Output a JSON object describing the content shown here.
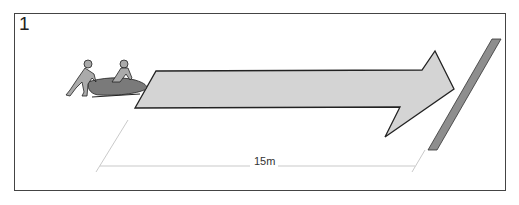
{
  "panel": {
    "number": "1"
  },
  "diagram": {
    "distance_label": "15m",
    "colors": {
      "arrow_fill": "#d4d4d4",
      "arrow_stroke": "#222222",
      "line_fill": "#8e8e8e",
      "sled_fill": "#7a7a7a",
      "figure_fill": "#aaaaaa",
      "frame": "#444444",
      "dimension_line": "#bbbbbb"
    }
  }
}
